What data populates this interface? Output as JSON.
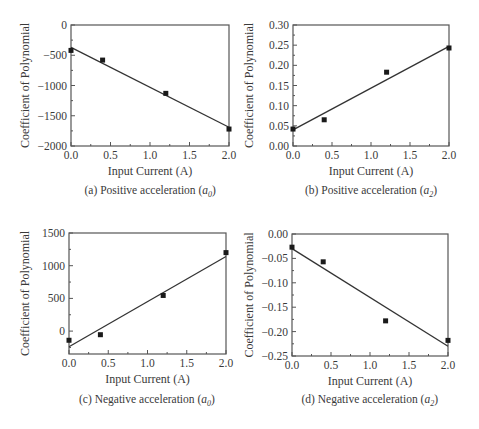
{
  "chart_data": [
    {
      "id": "a",
      "type": "scatter",
      "title": "",
      "caption": "(a) Positive acceleration (a0)",
      "caption_prefix": "(a) Positive acceleration (",
      "caption_var": "a",
      "caption_sub": "0",
      "xlabel": "Input Current (A)",
      "ylabel": "Coefficient of Polynomial",
      "xlim": [
        0,
        2.0
      ],
      "ylim": [
        -2000,
        0
      ],
      "xticks": [
        "0.0",
        "0.5",
        "1.0",
        "1.5",
        "2.0"
      ],
      "yticks": [
        "0",
        "−500",
        "−1000",
        "−1500",
        "−2000"
      ],
      "ytick_values": [
        0,
        -500,
        -1000,
        -1500,
        -2000
      ],
      "series": [
        {
          "name": "measured",
          "x": [
            0.0,
            0.4,
            1.2,
            2.0
          ],
          "y": [
            -420,
            -580,
            -1130,
            -1720
          ]
        },
        {
          "name": "linear fit",
          "x": [
            0.0,
            2.0
          ],
          "y": [
            -370,
            -1690
          ]
        }
      ],
      "grid": false,
      "legend": false
    },
    {
      "id": "b",
      "type": "scatter",
      "title": "",
      "caption": "(b) Positive acceleration (a2)",
      "caption_prefix": "(b) Positive acceleration (",
      "caption_var": "a",
      "caption_sub": "2",
      "xlabel": "Input Current (A)",
      "ylabel": "Coefficient of Polynomial",
      "xlim": [
        0,
        2.0
      ],
      "ylim": [
        0,
        0.3
      ],
      "xticks": [
        "0.0",
        "0.5",
        "1.0",
        "1.5",
        "2.0"
      ],
      "yticks": [
        "0.30",
        "0.25",
        "0.20",
        "0.15",
        "0.10",
        "0.05",
        "0.00"
      ],
      "ytick_values": [
        0.3,
        0.25,
        0.2,
        0.15,
        0.1,
        0.05,
        0.0
      ],
      "series": [
        {
          "name": "measured",
          "x": [
            0.0,
            0.4,
            1.2,
            2.0
          ],
          "y": [
            0.042,
            0.065,
            0.183,
            0.243
          ]
        },
        {
          "name": "linear fit",
          "x": [
            0.0,
            2.0
          ],
          "y": [
            0.04,
            0.247
          ]
        }
      ],
      "grid": false,
      "legend": false
    },
    {
      "id": "c",
      "type": "scatter",
      "title": "",
      "caption": "(c) Negative acceleration (a0)",
      "caption_prefix": "(c) Negative acceleration (",
      "caption_var": "a",
      "caption_sub": "0",
      "xlabel": "Input Current (A)",
      "ylabel": "Coefficient of Polynomial",
      "xlim": [
        0,
        2.0
      ],
      "ylim": [
        -350,
        1500
      ],
      "xticks": [
        "0.0",
        "0.5",
        "1.0",
        "1.5",
        "2.0"
      ],
      "yticks": [
        "1500",
        "1000",
        "500",
        "0"
      ],
      "ytick_values": [
        1500,
        1000,
        500,
        0
      ],
      "series": [
        {
          "name": "measured",
          "x": [
            0.0,
            0.4,
            1.2,
            2.0
          ],
          "y": [
            -140,
            -55,
            545,
            1200
          ]
        },
        {
          "name": "linear fit",
          "x": [
            0.0,
            2.0
          ],
          "y": [
            -240,
            1140
          ]
        }
      ],
      "grid": false,
      "legend": false
    },
    {
      "id": "d",
      "type": "scatter",
      "title": "",
      "caption": "(d) Negative acceleration (a2)",
      "caption_prefix": "(d) Negative acceleration (",
      "caption_var": "a",
      "caption_sub": "2",
      "xlabel": "Input Current (A)",
      "ylabel": "Coefficient of Polynomial",
      "xlim": [
        0,
        2.0
      ],
      "ylim": [
        -0.25,
        0
      ],
      "xticks": [
        "0.0",
        "0.5",
        "1.0",
        "1.5",
        "2.0"
      ],
      "yticks": [
        "0.00",
        "−0.05",
        "−0.10",
        "−0.15",
        "−0.20",
        "−0.25"
      ],
      "ytick_values": [
        0.0,
        -0.05,
        -0.1,
        -0.15,
        -0.2,
        -0.25
      ],
      "series": [
        {
          "name": "measured",
          "x": [
            0.0,
            0.4,
            1.2,
            2.0
          ],
          "y": [
            -0.027,
            -0.057,
            -0.178,
            -0.218
          ]
        },
        {
          "name": "linear fit",
          "x": [
            0.0,
            2.0
          ],
          "y": [
            -0.03,
            -0.23
          ]
        }
      ],
      "grid": false,
      "legend": false
    }
  ],
  "layout": {
    "frames": [
      {
        "left": 71,
        "top": 25,
        "right": 229,
        "bottom": 146,
        "caption_top": 184,
        "caption_center": 150,
        "xlabel_top": 160
      },
      {
        "left": 293,
        "top": 25,
        "right": 449,
        "bottom": 146,
        "caption_top": 184,
        "caption_center": 371,
        "xlabel_top": 160
      },
      {
        "left": 69,
        "top": 233,
        "right": 226,
        "bottom": 354,
        "caption_top": 393,
        "caption_center": 147,
        "xlabel_top": 369
      },
      {
        "left": 292,
        "top": 234,
        "right": 448,
        "bottom": 356,
        "caption_top": 393,
        "caption_center": 370,
        "xlabel_top": 371
      }
    ],
    "colors": {
      "axis": "#555555",
      "line": "#333333",
      "marker": "#1a1a1a",
      "text": "#3a3a3a"
    }
  }
}
